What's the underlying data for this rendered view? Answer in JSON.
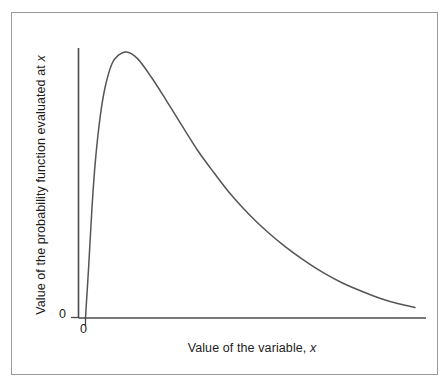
{
  "figure": {
    "background_color": "#ffffff",
    "frame_color": "#9a9a9a",
    "bottom_bar_color": "#4c4c4c",
    "axis_color": "#4a4a4a",
    "curve_color": "#555555"
  },
  "axes": {
    "y_label_prefix": "Value of the probability function evaluated at ",
    "y_label_variable": "x",
    "x_label_prefix": "Value of the variable, ",
    "x_label_variable": "x",
    "y_zero_tick": "0",
    "x_zero_tick": "0"
  },
  "chart_data": {
    "type": "line",
    "title": "",
    "subtitle": "",
    "xlabel": "Value of the variable, x",
    "ylabel": "Value of the probability function evaluated at x",
    "grid": false,
    "legend": null,
    "xlim": [
      0,
      1
    ],
    "ylim": [
      0,
      1
    ],
    "xticks": [
      "0"
    ],
    "yticks": [
      "0"
    ],
    "annotations": [],
    "series": [
      {
        "name": "probability density function",
        "description": "Right-skewed unimodal probability density curve rising steeply from the origin to a peak near the left, then decaying with a long right tail asymptotic to the horizontal axis.",
        "x": [
          0.0,
          0.01,
          0.02,
          0.03,
          0.045,
          0.06,
          0.08,
          0.1,
          0.125,
          0.158,
          0.2,
          0.245,
          0.29,
          0.34,
          0.39,
          0.44,
          0.495,
          0.55,
          0.605,
          0.66,
          0.72,
          0.78,
          0.84,
          0.9,
          0.95,
          1.0
        ],
        "y": [
          0.0,
          0.2,
          0.42,
          0.59,
          0.76,
          0.87,
          0.955,
          0.988,
          1.0,
          0.975,
          0.905,
          0.818,
          0.728,
          0.63,
          0.545,
          0.465,
          0.39,
          0.325,
          0.268,
          0.218,
          0.17,
          0.13,
          0.098,
          0.07,
          0.052,
          0.038
        ]
      }
    ]
  }
}
